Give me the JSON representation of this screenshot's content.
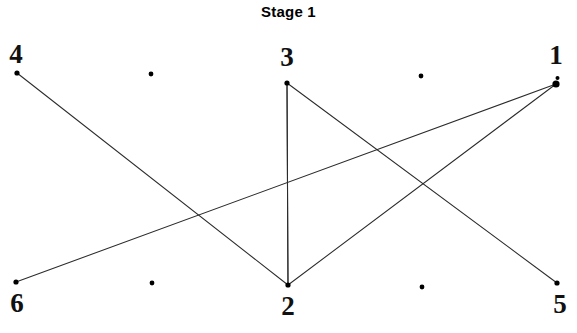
{
  "figure": {
    "title": "Stage 1",
    "width": 577,
    "height": 333,
    "background_color": "#ffffff",
    "ink_color": "#000000",
    "line_color": "#333333"
  },
  "graph": {
    "type": "node-link-diagram",
    "nodes": [
      {
        "id": "1",
        "label": "1",
        "x": 556,
        "y": 84,
        "label_x": 556,
        "label_y": 42,
        "marker": "large-dot"
      },
      {
        "id": "2",
        "label": "2",
        "x": 288,
        "y": 285,
        "label_x": 288,
        "label_y": 293,
        "marker": "dot"
      },
      {
        "id": "3",
        "label": "3",
        "x": 287,
        "y": 83,
        "label_x": 287,
        "label_y": 44,
        "marker": "dot"
      },
      {
        "id": "4",
        "label": "4",
        "x": 17,
        "y": 73,
        "label_x": 16,
        "label_y": 41,
        "marker": "dot"
      },
      {
        "id": "5",
        "label": "5",
        "x": 557,
        "y": 283,
        "label_x": 560,
        "label_y": 291,
        "marker": "dot"
      },
      {
        "id": "6",
        "label": "6",
        "x": 16,
        "y": 282,
        "label_x": 17,
        "label_y": 290,
        "marker": "dot"
      }
    ],
    "unlabeled_points": [
      {
        "x": 151,
        "y": 74
      },
      {
        "x": 421,
        "y": 76
      },
      {
        "x": 152,
        "y": 283
      },
      {
        "x": 422,
        "y": 287
      }
    ],
    "edges": [
      {
        "from": "4",
        "to": "2"
      },
      {
        "from": "3",
        "to": "2"
      },
      {
        "from": "3",
        "to": "2",
        "note": "vertical"
      },
      {
        "from": "3",
        "to": "5"
      },
      {
        "from": "6",
        "to": "1"
      },
      {
        "from": "2",
        "to": "1"
      }
    ]
  }
}
